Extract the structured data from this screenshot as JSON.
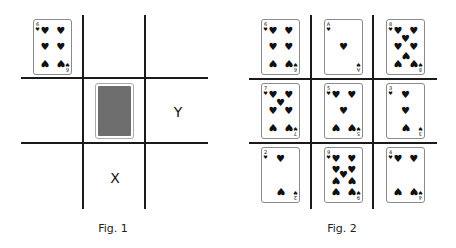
{
  "fig1": {
    "caption": "Fig. 1",
    "card": {
      "rank": "6",
      "suit": "heart"
    },
    "face_down_card": "card-back",
    "labels": {
      "x": "X",
      "y": "Y"
    }
  },
  "fig2": {
    "caption": "Fig. 2",
    "grid": [
      [
        {
          "rank": "6",
          "suit": "heart"
        },
        {
          "rank": "A",
          "suit": "heart"
        },
        {
          "rank": "8",
          "suit": "heart"
        }
      ],
      [
        {
          "rank": "7",
          "suit": "heart"
        },
        {
          "rank": "5",
          "suit": "heart"
        },
        {
          "rank": "3",
          "suit": "heart"
        }
      ],
      [
        {
          "rank": "2",
          "suit": "heart"
        },
        {
          "rank": "9",
          "suit": "heart"
        },
        {
          "rank": "4",
          "suit": "heart"
        }
      ]
    ]
  },
  "icons": {
    "heart": "♥"
  },
  "colors": {
    "line": "#1a1a1a",
    "card_back": "#6e6e6e",
    "card_border": "#8a8a8a"
  }
}
